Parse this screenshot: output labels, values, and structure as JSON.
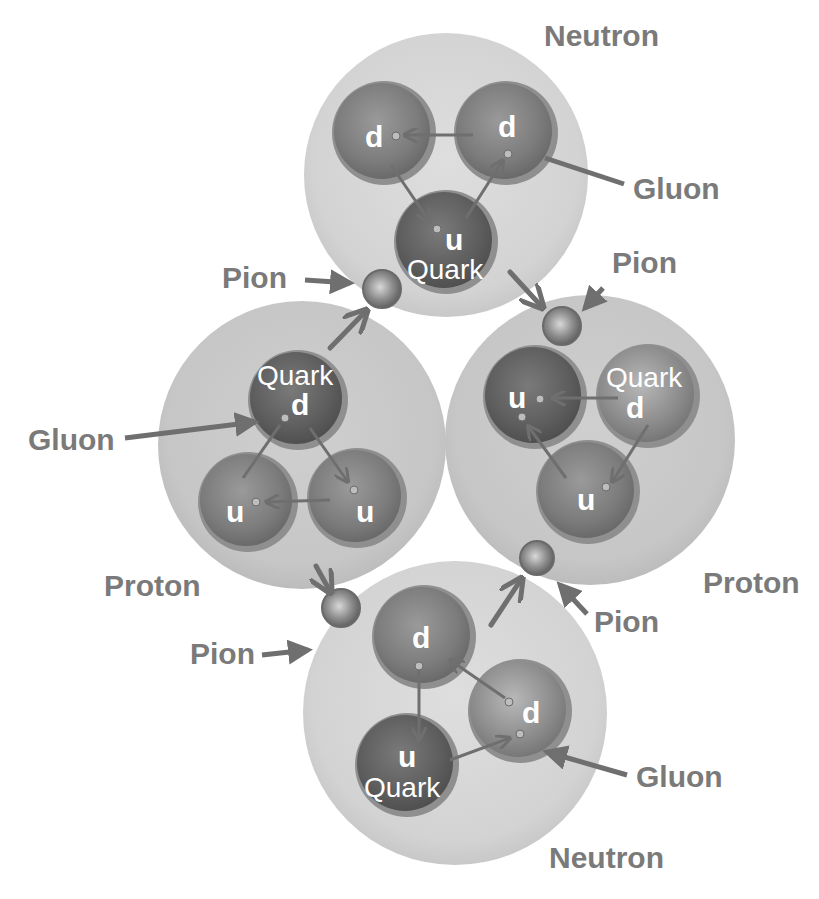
{
  "diagram": {
    "colors": {
      "nucleon_fill": "#d6d6d6",
      "proton_fill": "#c9c9c9",
      "quark_fill": "#7d7d7d",
      "quark_rim": "#9a9a9a",
      "arrow": "#6f6f6f",
      "label": "#7a7a7a",
      "background": "#ffffff"
    },
    "nucleons": [
      {
        "label": "Neutron",
        "position": "top",
        "quarks": [
          {
            "flavor": "d"
          },
          {
            "flavor": "d"
          },
          {
            "flavor": "u",
            "caption": "Quark"
          }
        ],
        "gluon_label": "Gluon"
      },
      {
        "label": "Proton",
        "position": "left",
        "quarks": [
          {
            "flavor": "d",
            "caption": "Quark"
          },
          {
            "flavor": "u"
          },
          {
            "flavor": "u"
          }
        ],
        "gluon_label": "Gluon"
      },
      {
        "label": "Proton",
        "position": "right",
        "quarks": [
          {
            "flavor": "u"
          },
          {
            "flavor": "d",
            "caption": "Quark"
          },
          {
            "flavor": "u"
          }
        ]
      },
      {
        "label": "Neutron",
        "position": "bottom",
        "quarks": [
          {
            "flavor": "d"
          },
          {
            "flavor": "u",
            "caption": "Quark"
          },
          {
            "flavor": "d"
          }
        ],
        "gluon_label": "Gluon"
      }
    ],
    "pions": [
      {
        "label": "Pion",
        "position": "top-left"
      },
      {
        "label": "Pion",
        "position": "top-right"
      },
      {
        "label": "Pion",
        "position": "bottom-left"
      },
      {
        "label": "Pion",
        "position": "bottom-right"
      }
    ]
  }
}
